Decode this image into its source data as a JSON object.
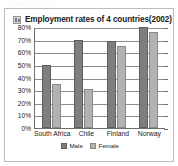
{
  "scan_artifact_text": "· ·· ····· ·· ··· ·· ·",
  "title": {
    "icon": "chart-thumbnail-icon",
    "text": "Employment rates of 4 countries(2002)"
  },
  "legend": {
    "position": "bottom-center",
    "items": [
      {
        "label": "Male",
        "color": "#7e7e7e"
      },
      {
        "label": "Female",
        "color": "#b2b2b2"
      }
    ]
  },
  "chart_data": {
    "type": "bar",
    "title": "Employment rates of 4 countries(2002)",
    "xlabel": "",
    "ylabel": "",
    "categories": [
      "South Africa",
      "Chile",
      "Finland",
      "Norway"
    ],
    "series": [
      {
        "name": "Male",
        "color": "#7e7e7e",
        "values": [
          50,
          70,
          69,
          80
        ]
      },
      {
        "name": "Female",
        "color": "#b2b2b2",
        "values": [
          35,
          31,
          65,
          76
        ]
      }
    ],
    "ylim": [
      0,
      80
    ],
    "ytick_values": [
      0,
      10,
      20,
      30,
      40,
      50,
      60,
      70,
      80
    ],
    "ytick_labels": [
      "0%",
      "10%",
      "20%",
      "30%",
      "40%",
      "50%",
      "60%",
      "70%",
      "80%"
    ],
    "grid": true,
    "legend": [
      "Male",
      "Female"
    ]
  }
}
